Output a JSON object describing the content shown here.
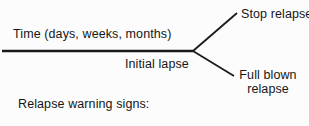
{
  "diagram": {
    "time_axis_label": "Time (days, weeks, months)",
    "initial_lapse_label": "Initial lapse",
    "branches": {
      "stop_relapse_label": "Stop relapse",
      "full_blown_relapse_label": "Full blown relapse"
    },
    "caption": "Relapse warning signs:",
    "line_color": "#1a1a1a",
    "background_color": "#fcfcfc"
  }
}
